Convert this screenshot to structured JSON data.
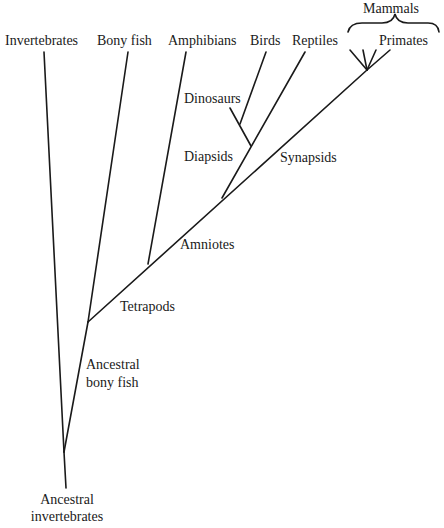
{
  "diagram": {
    "type": "phylogenetic-tree",
    "colors": {
      "line": "#1a1a1a",
      "text": "#1a1a1a",
      "background": "#ffffff"
    },
    "tips": {
      "invertebrates": "Invertebrates",
      "bony_fish": "Bony fish",
      "amphibians": "Amphibians",
      "birds": "Birds",
      "reptiles": "Reptiles",
      "mammals": "Mammals",
      "primates": "Primates"
    },
    "clades": {
      "dinosaurs": "Dinosaurs",
      "diapsids": "Diapsids",
      "synapsids": "Synapsids",
      "amniotes": "Amniotes",
      "tetrapods": "Tetrapods",
      "ancestral_bony_fish_1": "Ancestral",
      "ancestral_bony_fish_2": "bony fish",
      "ancestral_invertebrates_1": "Ancestral",
      "ancestral_invertebrates_2": "invertebrates"
    }
  }
}
